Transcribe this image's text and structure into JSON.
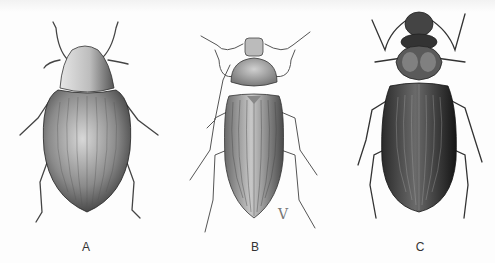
{
  "plate": {
    "description": "Scientific illustration plate of three beetles, dorsal view",
    "figures": [
      {
        "id": "A",
        "label": "A",
        "shape": "oval-rounded",
        "shading": "medium-stippled"
      },
      {
        "id": "B",
        "label": "B",
        "shape": "elongate",
        "shading": "light-striated"
      },
      {
        "id": "C",
        "label": "C",
        "shape": "elongate-constricted",
        "shading": "dark-striated"
      }
    ],
    "signature_mark": "V",
    "colors": {
      "ink": "#2a2a2a",
      "paper": "#fdfdfd",
      "mid": "#777777"
    }
  }
}
